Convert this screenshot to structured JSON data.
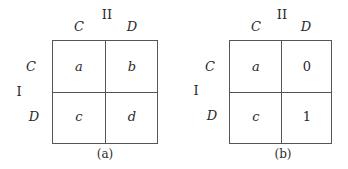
{
  "figures": [
    {
      "caption": "(a)",
      "player_row_label": "I",
      "player_col_label": "II",
      "col_strategies": [
        "C",
        "D"
      ],
      "row_strategies": [
        "C",
        "D"
      ],
      "cells": [
        [
          "a",
          "b"
        ],
        [
          "c",
          "d"
        ]
      ]
    },
    {
      "caption": "(b)",
      "player_row_label": "I",
      "player_col_label": "II",
      "col_strategies": [
        "C",
        "D"
      ],
      "row_strategies": [
        "C",
        "D"
      ],
      "cells": [
        [
          "a",
          "0"
        ],
        [
          "c",
          "1"
        ]
      ]
    }
  ]
}
